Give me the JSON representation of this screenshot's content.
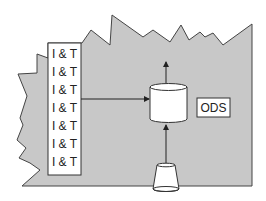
{
  "diagram": {
    "colors": {
      "background": "#ffffff",
      "region_fill": "#c8c8c8",
      "stroke": "#333333",
      "box_fill": "#ffffff"
    },
    "integration_box": {
      "items": [
        {
          "label": "I & T"
        },
        {
          "label": "I & T"
        },
        {
          "label": "I & T"
        },
        {
          "label": "I & T"
        },
        {
          "label": "I & T"
        },
        {
          "label": "I & T"
        },
        {
          "label": "I & T"
        }
      ]
    },
    "database": {
      "shape": "cylinder"
    },
    "ods_label": {
      "text": "ODS"
    },
    "source": {
      "shape": "cone"
    },
    "arrows": [
      {
        "from": "integration_box",
        "to": "database",
        "direction": "right"
      },
      {
        "from": "database",
        "to": "outside-top",
        "direction": "up"
      },
      {
        "from": "source",
        "to": "database",
        "direction": "up"
      }
    ]
  }
}
